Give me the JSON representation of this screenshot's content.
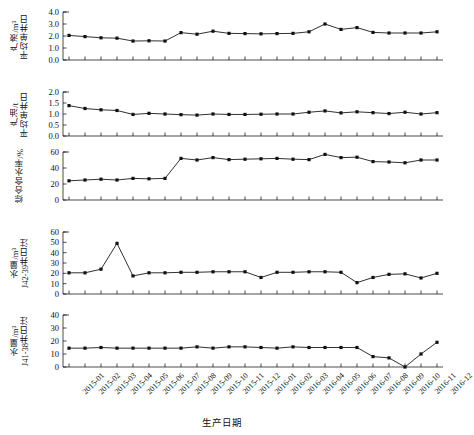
{
  "figure": {
    "xlabel": "生产日期",
    "n_points": 24
  },
  "chart_data": [
    {
      "type": "line",
      "panel_index": 0,
      "title": "",
      "ylabel": "平均单井日产液/m³",
      "ylabel_line1": "平均单井日",
      "ylabel_line2": "产液/m³",
      "xlabel": "生产日期",
      "ylim": [
        0.0,
        4.0
      ],
      "yticks": [
        "0.0",
        "1.0",
        "2.0",
        "3.0",
        "4.0"
      ],
      "ytick_values": [
        0.0,
        1.0,
        2.0,
        3.0,
        4.0
      ],
      "grid": false,
      "legend": "none",
      "categories": [
        "2015-01",
        "2015-02",
        "2015-03",
        "2015-04",
        "2015-05",
        "2015-06",
        "2015-07",
        "2015-08",
        "2015-09",
        "2015-10",
        "2015-11",
        "2015-12",
        "2016-01",
        "2016-02",
        "2016-03",
        "2016-04",
        "2016-05",
        "2016-06",
        "2016-07",
        "2016-08",
        "2016-09",
        "2016-10",
        "2016-11",
        "2016-12"
      ],
      "values": [
        2.05,
        1.95,
        1.85,
        1.82,
        1.58,
        1.6,
        1.58,
        2.28,
        2.15,
        2.4,
        2.22,
        2.2,
        2.18,
        2.2,
        2.22,
        2.35,
        3.0,
        2.55,
        2.7,
        2.3,
        2.25,
        2.25,
        2.25,
        2.35
      ]
    },
    {
      "type": "line",
      "panel_index": 1,
      "title": "",
      "ylabel": "平均单井日产油/t",
      "ylabel_line1": "平均单井日",
      "ylabel_line2": "产油/t",
      "xlabel": "生产日期",
      "ylim": [
        0.0,
        2.0
      ],
      "yticks": [
        "0.0",
        "0.5",
        "1.0",
        "1.5",
        "2.0"
      ],
      "ytick_values": [
        0.0,
        0.5,
        1.0,
        1.5,
        2.0
      ],
      "grid": false,
      "legend": "none",
      "categories": [
        "2015-01",
        "2015-02",
        "2015-03",
        "2015-04",
        "2015-05",
        "2015-06",
        "2015-07",
        "2015-08",
        "2015-09",
        "2015-10",
        "2015-11",
        "2015-12",
        "2016-01",
        "2016-02",
        "2016-03",
        "2016-04",
        "2016-05",
        "2016-06",
        "2016-07",
        "2016-08",
        "2016-09",
        "2016-10",
        "2016-11",
        "2016-12"
      ],
      "values": [
        1.38,
        1.25,
        1.19,
        1.16,
        0.98,
        1.03,
        1.0,
        0.97,
        0.95,
        1.0,
        0.98,
        0.98,
        0.99,
        1.0,
        1.0,
        1.08,
        1.14,
        1.05,
        1.1,
        1.06,
        1.02,
        1.08,
        1.0,
        1.06
      ]
    },
    {
      "type": "line",
      "panel_index": 2,
      "title": "",
      "ylabel": "综合含水率/%",
      "ylabel_line1": "综合含水率/%",
      "ylabel_line2": "",
      "xlabel": "生产日期",
      "ylim": [
        0,
        60
      ],
      "yticks": [
        "0",
        "20",
        "40",
        "60"
      ],
      "ytick_values": [
        0,
        20,
        40,
        60
      ],
      "grid": false,
      "legend": "none",
      "categories": [
        "2015-01",
        "2015-02",
        "2015-03",
        "2015-04",
        "2015-05",
        "2015-06",
        "2015-07",
        "2015-08",
        "2015-09",
        "2015-10",
        "2015-11",
        "2015-12",
        "2016-01",
        "2016-02",
        "2016-03",
        "2016-04",
        "2016-05",
        "2016-06",
        "2016-07",
        "2016-08",
        "2016-09",
        "2016-10",
        "2016-11",
        "2016-12"
      ],
      "values": [
        24,
        25,
        26,
        25,
        27,
        26.5,
        27,
        52,
        50,
        53,
        50.5,
        51,
        51.5,
        52,
        51,
        50.5,
        57,
        53,
        53.5,
        48,
        47.5,
        46.5,
        50,
        50
      ]
    },
    {
      "type": "line",
      "panel_index": 3,
      "title": "",
      "ylabel": "J42-39井日注水量/m³",
      "ylabel_line1": "J42-39井日注",
      "ylabel_line2": "水量/m³",
      "xlabel": "生产日期",
      "ylim": [
        0,
        60
      ],
      "yticks": [
        "0",
        "10",
        "20",
        "30",
        "40",
        "50",
        "60"
      ],
      "ytick_values": [
        0,
        10,
        20,
        30,
        40,
        50,
        60
      ],
      "grid": false,
      "legend": "none",
      "categories": [
        "2015-01",
        "2015-02",
        "2015-03",
        "2015-04",
        "2015-05",
        "2015-06",
        "2015-07",
        "2015-08",
        "2015-09",
        "2015-10",
        "2015-11",
        "2015-12",
        "2016-01",
        "2016-02",
        "2016-03",
        "2016-04",
        "2016-05",
        "2016-06",
        "2016-07",
        "2016-08",
        "2016-09",
        "2016-10",
        "2016-11",
        "2016-12"
      ],
      "values": [
        20.5,
        20.5,
        24,
        49,
        17.5,
        20.5,
        20.5,
        21,
        21,
        21.5,
        21.5,
        21.5,
        16,
        21,
        21,
        21.5,
        21.5,
        21,
        11,
        16,
        19,
        19.5,
        15.5,
        20
      ]
    },
    {
      "type": "line",
      "panel_index": 4,
      "title": "",
      "ylabel": "J41-38井日注水量/m³",
      "ylabel_line1": "J41-38井日注",
      "ylabel_line2": "水量/m³",
      "xlabel": "生产日期",
      "ylim": [
        0,
        40
      ],
      "yticks": [
        "0",
        "10",
        "20",
        "30",
        "40"
      ],
      "ytick_values": [
        0,
        10,
        20,
        30,
        40
      ],
      "grid": false,
      "legend": "none",
      "categories": [
        "2015-01",
        "2015-02",
        "2015-03",
        "2015-04",
        "2015-05",
        "2015-06",
        "2015-07",
        "2015-08",
        "2015-09",
        "2015-10",
        "2015-11",
        "2015-12",
        "2016-01",
        "2016-02",
        "2016-03",
        "2016-04",
        "2016-05",
        "2016-06",
        "2016-07",
        "2016-08",
        "2016-09",
        "2016-10",
        "2016-11",
        "2016-12"
      ],
      "values": [
        14.5,
        14.5,
        15,
        14.5,
        14.5,
        14.5,
        14.5,
        14.5,
        15.5,
        14.5,
        15.5,
        15.5,
        15,
        14.5,
        15.5,
        15,
        15,
        15,
        15,
        8,
        7,
        0,
        10,
        19
      ]
    }
  ]
}
